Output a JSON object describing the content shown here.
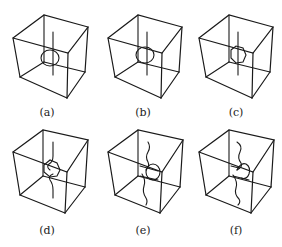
{
  "figure": {
    "panels": [
      {
        "id": "a",
        "label": "(a)",
        "variant": "straight-line-ring"
      },
      {
        "id": "b",
        "label": "(b)",
        "variant": "straight-line-ring"
      },
      {
        "id": "c",
        "label": "(c)",
        "variant": "straight-line-faceted-ring"
      },
      {
        "id": "d",
        "label": "(d)",
        "variant": "bent-line-faceted-ring"
      },
      {
        "id": "e",
        "label": "(e)",
        "variant": "wavy-line-ring"
      },
      {
        "id": "f",
        "label": "(f)",
        "variant": "wavy-line-open-ring"
      }
    ],
    "colors": {
      "stroke": "#1a1a1a",
      "background": "#ffffff",
      "text": "#222222"
    }
  }
}
